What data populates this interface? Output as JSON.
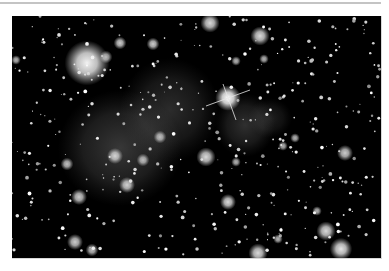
{
  "image": {
    "alt": "Galaxy cluster field with diffuse gas clouds and bright foreground star",
    "frame": {
      "x": 12,
      "y": 16,
      "width": 369,
      "height": 242
    },
    "background_color": "#000000",
    "clouds": [
      {
        "x": 120,
        "y": 148,
        "rx": 62,
        "ry": 58,
        "alpha": 0.28
      },
      {
        "x": 170,
        "y": 110,
        "rx": 50,
        "ry": 52,
        "alpha": 0.22
      },
      {
        "x": 245,
        "y": 125,
        "rx": 30,
        "ry": 32,
        "alpha": 0.24
      },
      {
        "x": 270,
        "y": 118,
        "rx": 22,
        "ry": 20,
        "alpha": 0.16
      }
    ],
    "bright_objects": [
      {
        "x": 87,
        "y": 63,
        "r": 14,
        "b": 0.95
      },
      {
        "x": 228,
        "y": 98,
        "r": 8,
        "b": 1.0,
        "spikes": true
      },
      {
        "x": 210,
        "y": 23,
        "r": 6,
        "b": 0.85
      },
      {
        "x": 260,
        "y": 36,
        "r": 6,
        "b": 0.85
      },
      {
        "x": 120,
        "y": 43,
        "r": 4,
        "b": 0.8
      },
      {
        "x": 106,
        "y": 57,
        "r": 4,
        "b": 0.7
      },
      {
        "x": 153,
        "y": 44,
        "r": 4,
        "b": 0.8
      },
      {
        "x": 16,
        "y": 60,
        "r": 3,
        "b": 0.7
      },
      {
        "x": 115,
        "y": 156,
        "r": 5,
        "b": 0.8
      },
      {
        "x": 206,
        "y": 157,
        "r": 6,
        "b": 0.85
      },
      {
        "x": 67,
        "y": 164,
        "r": 4,
        "b": 0.75
      },
      {
        "x": 79,
        "y": 197,
        "r": 5,
        "b": 0.8
      },
      {
        "x": 127,
        "y": 185,
        "r": 5,
        "b": 0.8
      },
      {
        "x": 143,
        "y": 160,
        "r": 4,
        "b": 0.7
      },
      {
        "x": 160,
        "y": 137,
        "r": 4,
        "b": 0.7
      },
      {
        "x": 345,
        "y": 153,
        "r": 5,
        "b": 0.8
      },
      {
        "x": 228,
        "y": 202,
        "r": 5,
        "b": 0.85
      },
      {
        "x": 326,
        "y": 231,
        "r": 6,
        "b": 0.85
      },
      {
        "x": 341,
        "y": 249,
        "r": 7,
        "b": 0.9
      },
      {
        "x": 258,
        "y": 253,
        "r": 6,
        "b": 0.85
      },
      {
        "x": 75,
        "y": 242,
        "r": 5,
        "b": 0.8
      },
      {
        "x": 92,
        "y": 250,
        "r": 4,
        "b": 0.75
      },
      {
        "x": 278,
        "y": 239,
        "r": 3,
        "b": 0.7
      },
      {
        "x": 317,
        "y": 211,
        "r": 3,
        "b": 0.7
      },
      {
        "x": 236,
        "y": 162,
        "r": 3,
        "b": 0.7
      },
      {
        "x": 283,
        "y": 146,
        "r": 3,
        "b": 0.7
      },
      {
        "x": 236,
        "y": 61,
        "r": 3,
        "b": 0.7
      },
      {
        "x": 264,
        "y": 59,
        "r": 3,
        "b": 0.7
      },
      {
        "x": 295,
        "y": 138,
        "r": 3,
        "b": 0.7
      }
    ],
    "faint_star_count": 420,
    "seed": 7
  }
}
